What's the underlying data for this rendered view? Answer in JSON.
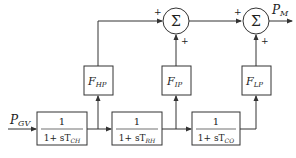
{
  "diagram": {
    "type": "block-diagram",
    "input": {
      "symbol": "P",
      "sub": "GV"
    },
    "output": {
      "symbol": "P",
      "sub": "M"
    },
    "lag_blocks": [
      {
        "id": "ch",
        "numerator": "1",
        "denominator_prefix": "1+ sT",
        "sub": "CH"
      },
      {
        "id": "rh",
        "numerator": "1",
        "denominator_prefix": "1+ sT",
        "sub": "RH"
      },
      {
        "id": "co",
        "numerator": "1",
        "denominator_prefix": "1+ sT",
        "sub": "CO"
      }
    ],
    "gain_blocks": [
      {
        "id": "hp",
        "symbol": "F",
        "sub": "HP"
      },
      {
        "id": "ip",
        "symbol": "F",
        "sub": "IP"
      },
      {
        "id": "lp",
        "symbol": "F",
        "sub": "LP"
      }
    ],
    "summers": [
      {
        "id": "sum1",
        "symbol": "Σ",
        "sign_left": "+",
        "sign_bottom": "+"
      },
      {
        "id": "sum2",
        "symbol": "Σ",
        "sign_left": "+",
        "sign_bottom": "+"
      }
    ],
    "colors": {
      "line": "#333333",
      "box_fill": "#ffffff",
      "text": "#222222"
    }
  }
}
